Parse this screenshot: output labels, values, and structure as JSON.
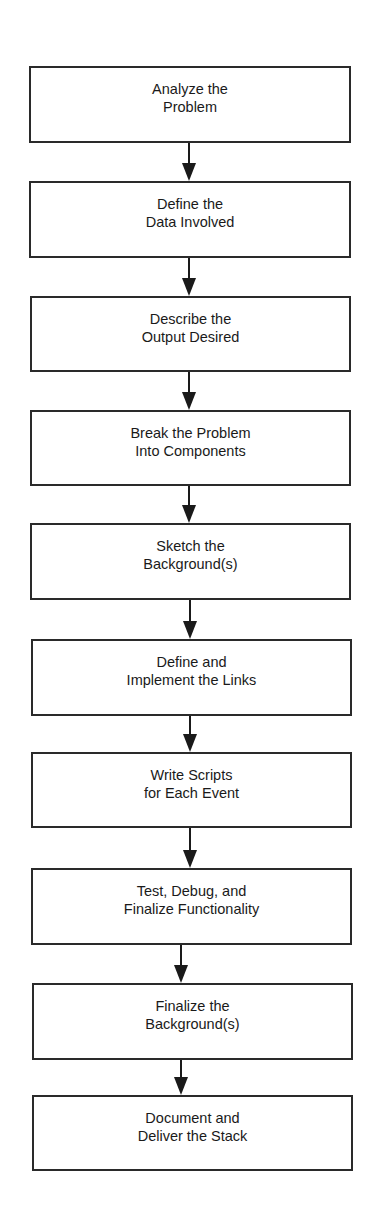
{
  "diagram": {
    "type": "flowchart",
    "direction": "top-to-bottom",
    "colors": {
      "border": "#2a2a2a",
      "text": "#1a1a1a",
      "background": "#ffffff"
    },
    "steps": [
      {
        "lines": [
          "Analyze the",
          "Problem"
        ]
      },
      {
        "lines": [
          "Define the",
          "Data Involved"
        ]
      },
      {
        "lines": [
          "Describe the",
          "Output Desired"
        ]
      },
      {
        "lines": [
          "Break the Problem",
          "Into Components"
        ]
      },
      {
        "lines": [
          "Sketch the",
          "Background(s)"
        ]
      },
      {
        "lines": [
          "Define and",
          "Implement the Links"
        ]
      },
      {
        "lines": [
          "Write Scripts",
          "for Each Event"
        ]
      },
      {
        "lines": [
          "Test, Debug, and",
          "Finalize Functionality"
        ]
      },
      {
        "lines": [
          "Finalize the",
          "Background(s)"
        ]
      },
      {
        "lines": [
          "Document and",
          "Deliver the Stack"
        ]
      }
    ]
  }
}
